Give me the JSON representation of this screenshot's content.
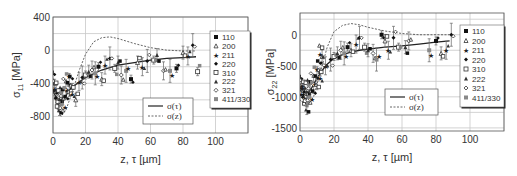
{
  "chart_data": [
    {
      "type": "scatter",
      "title": "",
      "xlabel": "z, τ [µm]",
      "ylabel": "σ11 [MPa]",
      "ylabel_main": "σ",
      "ylabel_sub": "11",
      "ylabel_unit": " [MPa]",
      "xlim": [
        0,
        120
      ],
      "ylim": [
        -1000,
        400
      ],
      "xticks": [
        "0",
        "20",
        "40",
        "60",
        "80",
        "100"
      ],
      "yticks": [
        "400",
        "0",
        "-400",
        "-800"
      ],
      "grid": true,
      "legend_markers": [
        "110",
        "200",
        "211",
        "220",
        "310",
        "222",
        "321",
        "411/330"
      ],
      "legend_lines": [
        "σ(τ)",
        "σ(z)"
      ],
      "series": [
        {
          "name": "σ(τ)",
          "style": "solid",
          "x": [
            0,
            3,
            6,
            10,
            15,
            20,
            30,
            40,
            50,
            60,
            70,
            80,
            88
          ],
          "y": [
            -500,
            -600,
            -620,
            -480,
            -400,
            -330,
            -240,
            -180,
            -150,
            -120,
            -100,
            -90,
            -80
          ]
        },
        {
          "name": "σ(z)",
          "style": "dashed",
          "x": [
            0,
            3,
            5,
            8,
            12,
            16,
            20,
            25,
            30,
            35,
            40,
            50,
            60,
            70,
            80,
            88
          ],
          "y": [
            -500,
            -720,
            -800,
            -720,
            -500,
            -250,
            -50,
            100,
            150,
            160,
            140,
            80,
            30,
            0,
            -10,
            -10
          ]
        },
        {
          "name": "measured (all hkl)",
          "style": "markers",
          "x": [
            1,
            2,
            3,
            4,
            5,
            6,
            8,
            10,
            12,
            14,
            16,
            18,
            20,
            22,
            24,
            26,
            28,
            30,
            32,
            35,
            38,
            40,
            42,
            45,
            48,
            52,
            55,
            58,
            62,
            64,
            68,
            72,
            76,
            80,
            83,
            86,
            89
          ],
          "y": [
            -400,
            -500,
            -600,
            -650,
            -620,
            -580,
            -480,
            -420,
            -450,
            -600,
            -380,
            -330,
            -300,
            -260,
            -240,
            -280,
            -200,
            -350,
            -180,
            -100,
            -220,
            -150,
            -300,
            -250,
            -350,
            -150,
            -200,
            -130,
            -120,
            -60,
            -250,
            -250,
            -220,
            -30,
            -70,
            60,
            -260
          ]
        }
      ]
    },
    {
      "type": "scatter",
      "title": "",
      "xlabel": "z, τ [µm]",
      "ylabel": "σ22 [MPa]",
      "ylabel_main": "σ",
      "ylabel_sub": "22",
      "ylabel_unit": " [MPa]",
      "xlim": [
        0,
        120
      ],
      "ylim": [
        -1550,
        350
      ],
      "xticks": [
        "0",
        "20",
        "40",
        "60",
        "80",
        "100"
      ],
      "yticks": [
        "0",
        "-500",
        "-1000",
        "-1500"
      ],
      "grid": true,
      "legend_markers": [
        "110",
        "200",
        "211",
        "220",
        "310",
        "222",
        "321",
        "411/330"
      ],
      "legend_lines": [
        "σ(τ)",
        "σ(z)"
      ],
      "series": [
        {
          "name": "σ(τ)",
          "style": "solid",
          "x": [
            0,
            5,
            10,
            15,
            20,
            25,
            30,
            35,
            40,
            50,
            60,
            70,
            80,
            88
          ],
          "y": [
            -900,
            -950,
            -700,
            -500,
            -380,
            -320,
            -280,
            -250,
            -230,
            -200,
            -180,
            -150,
            -120,
            -100
          ]
        },
        {
          "name": "σ(z)",
          "style": "dashed",
          "x": [
            0,
            4,
            8,
            12,
            16,
            20,
            25,
            30,
            35,
            40,
            50,
            60,
            70,
            80,
            88
          ],
          "y": [
            -1050,
            -1150,
            -1000,
            -600,
            -200,
            50,
            150,
            180,
            160,
            120,
            60,
            20,
            0,
            0,
            0
          ]
        },
        {
          "name": "measured (all hkl)",
          "style": "markers",
          "x": [
            1,
            2,
            3,
            4,
            5,
            6,
            8,
            10,
            12,
            13,
            15,
            18,
            20,
            22,
            24,
            26,
            28,
            30,
            33,
            35,
            38,
            40,
            43,
            45,
            48,
            50,
            52,
            55,
            58,
            62,
            64,
            76,
            80,
            83,
            86,
            89
          ],
          "y": [
            -850,
            -900,
            -1000,
            -1100,
            -950,
            -900,
            -800,
            -700,
            -600,
            -350,
            -500,
            -400,
            -350,
            -300,
            -250,
            -300,
            -200,
            -250,
            -150,
            -50,
            -200,
            -250,
            -300,
            -400,
            0,
            -100,
            -250,
            -50,
            -200,
            -200,
            -100,
            -250,
            -100,
            -300,
            -250,
            0
          ]
        }
      ]
    }
  ]
}
